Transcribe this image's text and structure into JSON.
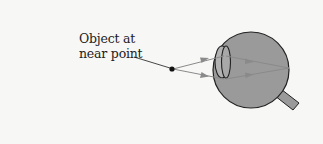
{
  "diagram": {
    "type": "optics-eye-diagram",
    "label": {
      "line1": "Object at",
      "line2": "near point"
    },
    "elements": {
      "object_point": "object-dot",
      "rays": 2,
      "eye": "eyeball-with-lens-and-optic-nerve"
    },
    "colors": {
      "background": "#f7f7f6",
      "eye_fill": "#9a9a9a",
      "outline": "#222222",
      "ray": "#8a8a8a",
      "lens_fill": "#b0b0b0"
    }
  }
}
